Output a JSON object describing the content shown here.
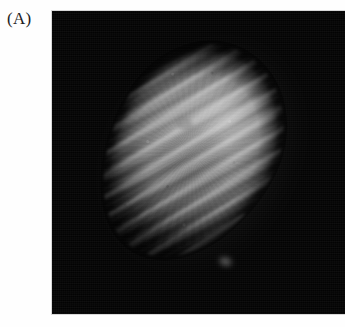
{
  "figure": {
    "panel_label": "(A)",
    "background_color": "#fefefe"
  },
  "micrograph": {
    "name": "micrograph-panel",
    "field_color": "#030303",
    "specimen_description": "elongated striated ellipsoidal specimen",
    "specimen_tint": "#bcbcbc",
    "orientation_degrees": 30,
    "striation_angle_degrees": 118,
    "panel_rect": {
      "left": 52,
      "top": 11,
      "width": 293,
      "height": 303
    },
    "specimen_rect": {
      "left": 115,
      "top": 48,
      "width": 152,
      "height": 208
    }
  }
}
